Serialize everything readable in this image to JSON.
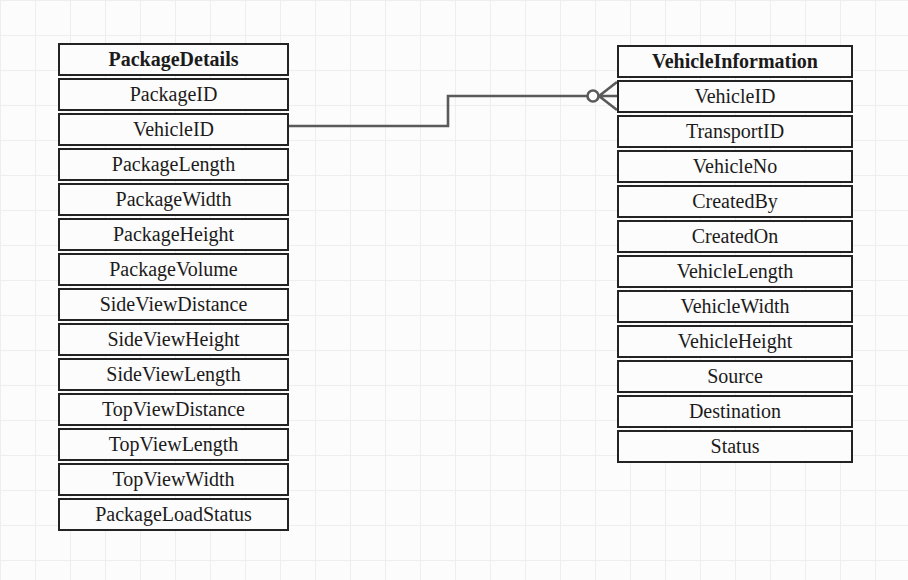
{
  "diagram": {
    "type": "entity-relationship",
    "entities": [
      {
        "name": "PackageDetails",
        "attributes": [
          "PackageID",
          "VehicleID",
          "PackageLength",
          "PackageWidth",
          "PackageHeight",
          "PackageVolume",
          "SideViewDistance",
          "SideViewHeight",
          "SideViewLength",
          "TopViewDistance",
          "TopViewLength",
          "TopViewWidth",
          "PackageLoadStatus"
        ]
      },
      {
        "name": "VehicleInformation",
        "attributes": [
          "VehicleID",
          "TransportID",
          "VehicleNo",
          "CreatedBy",
          "CreatedOn",
          "VehicleLength",
          "VehicleWidth",
          "VehicleHeight",
          "Source",
          "Destination",
          "Status"
        ]
      }
    ],
    "relationship": {
      "from_entity": "PackageDetails",
      "from_attribute": "VehicleID",
      "to_entity": "VehicleInformation",
      "to_attribute": "VehicleID",
      "to_cardinality": "zero-or-many (circle + crow's foot)"
    }
  },
  "colors": {
    "table-border": "#232323",
    "text": "#1b1b1b",
    "connector": "#5a5a5a",
    "background": "#fdfcfc",
    "grid-line": "#f0edee"
  }
}
